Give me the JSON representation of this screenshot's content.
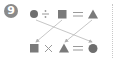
{
  "problem": {
    "number": "9",
    "top_equation": [
      "circle",
      "÷",
      "square",
      "=",
      "triangle"
    ],
    "bottom_equation": [
      "square",
      "×",
      "triangle",
      "=",
      "circle"
    ],
    "arrows": [
      {
        "from": "top-circle",
        "to": "bottom-circle"
      },
      {
        "from": "top-square",
        "to": "bottom-square"
      },
      {
        "from": "top-triangle",
        "to": "bottom-triangle"
      }
    ]
  },
  "colors": {
    "shape": "#7a7a7a",
    "operator": "#9a9a9a",
    "arrow": "#b0b0b0",
    "badge": "#8a8a8a"
  }
}
